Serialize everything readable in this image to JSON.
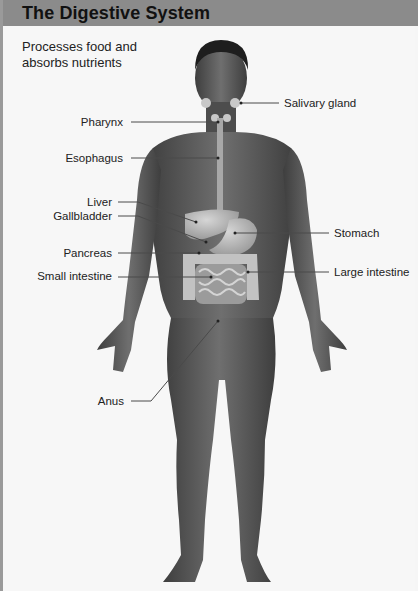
{
  "header": {
    "title": "The Digestive System"
  },
  "subtitle": "Processes food and absorbs nutrients",
  "colors": {
    "header_bg": "#8b8b8b",
    "page_bg": "#f7f7f7",
    "skin": "#5e5e5e",
    "organ": "#b9b9b9",
    "leader_line": "#555555"
  },
  "labels": {
    "salivary_gland": "Salivary gland",
    "pharynx": "Pharynx",
    "esophagus": "Esophagus",
    "liver": "Liver",
    "gallbladder": "Gallbladder",
    "stomach": "Stomach",
    "pancreas": "Pancreas",
    "small_intestine": "Small intestine",
    "large_intestine": "Large intestine",
    "anus": "Anus"
  }
}
